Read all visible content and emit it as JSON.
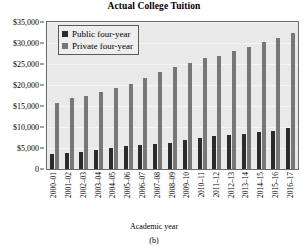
{
  "chart_data": {
    "type": "bar",
    "title": "Actual College Tuition",
    "xlabel": "Academic year",
    "ylabel": "",
    "ylim": [
      0,
      35000
    ],
    "ytick_values": [
      0,
      5000,
      10000,
      15000,
      20000,
      25000,
      30000,
      35000
    ],
    "ytick_labels": [
      "0",
      "$5,000",
      "$10,000",
      "$15,000",
      "$20,000",
      "$25,000",
      "$30,000",
      "$35,000"
    ],
    "grid": true,
    "legend_position": "top-left",
    "categories": [
      "2000–01",
      "2001–02",
      "2002–03",
      "2003–04",
      "2004–05",
      "2005–06",
      "2006–07",
      "2007–08",
      "2008–09",
      "2009–10",
      "2010–11",
      "2011–12",
      "2012–13",
      "2013–14",
      "2014–15",
      "2015–16",
      "2016–17"
    ],
    "series": [
      {
        "name": "Public four-year",
        "color": "#2b2b2b",
        "values": [
          3500,
          3800,
          4100,
          4600,
          5100,
          5400,
          5700,
          6000,
          6300,
          6900,
          7400,
          7800,
          8100,
          8400,
          8700,
          9000,
          9700
        ]
      },
      {
        "name": "Private four-year",
        "color": "#777777",
        "values": [
          15700,
          16900,
          17500,
          18400,
          19300,
          20300,
          21600,
          23000,
          24300,
          25200,
          26400,
          26900,
          28000,
          29100,
          30200,
          31200,
          32400
        ]
      }
    ]
  },
  "caption": "(b)"
}
